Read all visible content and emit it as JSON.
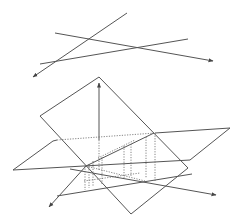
{
  "figure": {
    "width": 240,
    "height": 222,
    "background": "#ffffff",
    "stroke_color": "#555555",
    "top_diagram": {
      "description": "three skew lines in space",
      "lines": [
        {
          "name": "line-a",
          "from": [
            127,
            13
          ],
          "to": [
            33,
            77
          ],
          "arrow_at": "to"
        },
        {
          "name": "line-b",
          "from": [
            55,
            33
          ],
          "to": [
            213,
            61
          ],
          "arrow_at": "to"
        },
        {
          "name": "line-c",
          "from": [
            40,
            64
          ],
          "to": [
            188,
            39
          ],
          "arrow_at": "none"
        }
      ]
    },
    "bottom_diagram": {
      "description": "tilted plane intersecting horizontal plane with vertical axis, projected lines and dotted projection lines",
      "tilted_plane": [
        [
          99,
          77
        ],
        [
          40,
          116
        ],
        [
          131,
          214
        ],
        [
          188,
          168
        ]
      ],
      "horizontal_plane": [
        [
          13,
          170
        ],
        [
          53,
          140
        ],
        [
          230,
          128
        ],
        [
          190,
          160
        ]
      ],
      "vertical_axis": {
        "from": [
          99,
          150
        ],
        "to": [
          99,
          82
        ]
      }
    }
  }
}
